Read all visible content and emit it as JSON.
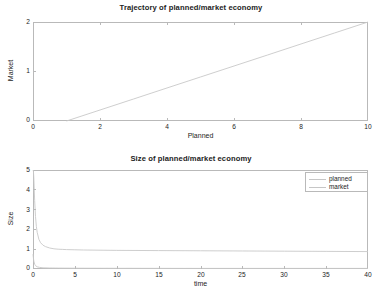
{
  "figure": {
    "background": "#ffffff",
    "axis_color": "#b9b9b9",
    "line_color": "#c8c8c8",
    "text_color": "#1d1d1d"
  },
  "chart_data": [
    {
      "type": "line",
      "title": "Trajectory of planned/market economy",
      "xlabel": "Planned",
      "ylabel": "Market",
      "xlim": [
        0,
        10
      ],
      "ylim": [
        0,
        2
      ],
      "xticks": [
        "0",
        "2",
        "4",
        "6",
        "8",
        "10"
      ],
      "xtick_values": [
        0,
        2,
        4,
        6,
        8,
        10
      ],
      "yticks": [
        "0",
        "1",
        "2"
      ],
      "ytick_values": [
        0,
        1,
        2
      ],
      "grid": false,
      "legend": null,
      "series": [
        {
          "name": "trajectory",
          "color": "#c8c8c8",
          "x": [
            1.0,
            2.0,
            3.0,
            4.0,
            5.0,
            6.0,
            7.0,
            8.0,
            9.0,
            10.0
          ],
          "y": [
            0.0,
            0.222,
            0.444,
            0.667,
            0.889,
            1.111,
            1.333,
            1.556,
            1.778,
            2.0
          ]
        }
      ]
    },
    {
      "type": "line",
      "title": "Size of planned/market economy",
      "xlabel": "time",
      "ylabel": "Size",
      "xlim": [
        0,
        40
      ],
      "ylim": [
        0,
        5
      ],
      "xticks": [
        "0",
        "5",
        "10",
        "15",
        "20",
        "25",
        "30",
        "35",
        "40"
      ],
      "xtick_values": [
        0,
        5,
        10,
        15,
        20,
        25,
        30,
        35,
        40
      ],
      "yticks": [
        "0",
        "1",
        "2",
        "3",
        "4",
        "5"
      ],
      "ytick_values": [
        0,
        1,
        2,
        3,
        4,
        5
      ],
      "grid": false,
      "legend": {
        "position": "top-right",
        "entries": [
          "planned",
          "market"
        ]
      },
      "series": [
        {
          "name": "planned",
          "color": "#c8c8c8",
          "x": [
            0.0,
            0.05,
            0.1,
            0.15,
            0.2,
            0.3,
            0.4,
            0.5,
            0.7,
            0.9,
            1.2,
            1.5,
            2.0,
            2.5,
            3.0,
            3.5,
            4.0,
            5.0,
            6.0,
            8.0,
            10.0,
            15.0,
            20.0,
            25.0,
            30.0,
            35.0,
            40.0
          ],
          "y": [
            5.0,
            4.95,
            4.6,
            4.0,
            3.45,
            2.65,
            2.15,
            1.85,
            1.5,
            1.33,
            1.2,
            1.13,
            1.06,
            1.02,
            1.0,
            0.99,
            0.98,
            0.97,
            0.96,
            0.95,
            0.94,
            0.93,
            0.92,
            0.91,
            0.9,
            0.89,
            0.88
          ]
        },
        {
          "name": "market",
          "color": "#c8c8c8",
          "x": [
            0.0,
            0.05,
            0.1,
            0.2,
            0.3,
            0.5,
            0.8,
            1.2,
            2.0,
            3.0,
            5.0,
            10.0,
            20.0,
            30.0,
            40.0
          ],
          "y": [
            0.75,
            0.55,
            0.4,
            0.24,
            0.17,
            0.11,
            0.08,
            0.06,
            0.05,
            0.045,
            0.04,
            0.035,
            0.03,
            0.03,
            0.03
          ]
        }
      ]
    }
  ]
}
